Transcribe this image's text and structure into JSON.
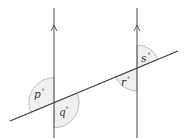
{
  "diagram": {
    "colors": {
      "line": "#4a4a4a",
      "arc_fill": "#f0f0f0",
      "arc_stroke": "#b0b0b0",
      "text": "#333333"
    },
    "parallel_lines": [
      {
        "x": 54,
        "arrow_y": 28,
        "direction": "up"
      },
      {
        "x": 137,
        "arrow_y": 28,
        "direction": "up"
      }
    ],
    "transversal": {
      "x1": 10,
      "y1": 121,
      "x2": 178,
      "y2": 51
    },
    "angles": [
      {
        "label": "p",
        "symbol": "°",
        "position": "upper-left of left intersection"
      },
      {
        "label": "q",
        "symbol": "°",
        "position": "lower-right of left intersection"
      },
      {
        "label": "r",
        "symbol": "°",
        "position": "lower-left of right intersection"
      },
      {
        "label": "s",
        "symbol": "°",
        "position": "upper-right of right intersection"
      }
    ]
  }
}
